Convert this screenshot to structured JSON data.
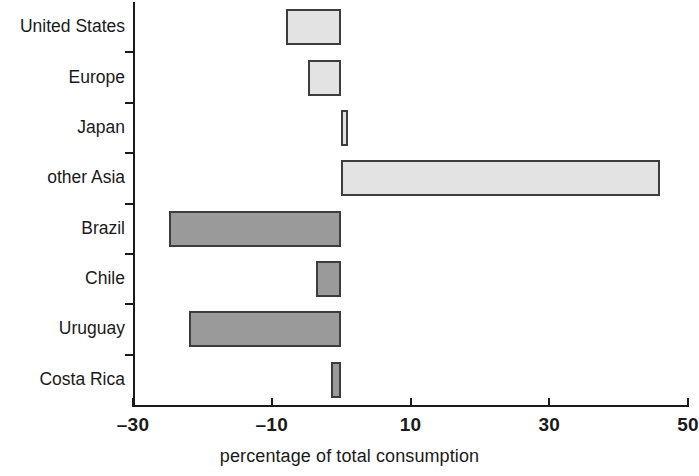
{
  "chart_data": {
    "type": "bar",
    "orientation": "horizontal",
    "title": "",
    "xlabel": "percentage of total consumption",
    "ylabel": "",
    "xlim": [
      -30,
      50
    ],
    "xticks": [
      -30,
      -10,
      10,
      30,
      50
    ],
    "xtick_labels": [
      "–30",
      "–10",
      "10",
      "30",
      "50"
    ],
    "grid": false,
    "legend": false,
    "categories": [
      "United States",
      "Europe",
      "Japan",
      "other Asia",
      "Brazil",
      "Chile",
      "Uruguay",
      "Costa Rica"
    ],
    "values": [
      -8.0,
      -4.8,
      1.0,
      46.0,
      -24.8,
      -3.6,
      -22.0,
      -1.4
    ],
    "bar_styles": [
      "light",
      "light",
      "light",
      "light",
      "dark",
      "dark",
      "dark",
      "dark"
    ],
    "colors": {
      "light_fill": "#e3e3e3",
      "dark_fill": "#9a9a9a",
      "bar_edge": "#3d3d3d",
      "axis": "#1a1a1a",
      "background": "#ffffff"
    }
  }
}
